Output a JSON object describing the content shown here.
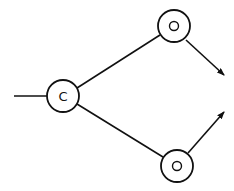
{
  "diagram": {
    "stroke_color": "#111111",
    "background": "#ffffff",
    "nodes": [
      {
        "id": "c",
        "label": "C",
        "cx": 63,
        "cy": 96,
        "r": 16
      },
      {
        "id": "o-top",
        "label": "O",
        "cx": 174,
        "cy": 26,
        "r": 16
      },
      {
        "id": "o-bottom",
        "label": "O",
        "cx": 177,
        "cy": 166,
        "r": 16
      }
    ],
    "edges": [
      {
        "from": "input",
        "to": "c",
        "arrow": false
      },
      {
        "from": "c",
        "to": "o-top",
        "arrow": false
      },
      {
        "from": "c",
        "to": "o-bottom",
        "arrow": false
      },
      {
        "from": "o-top",
        "to": "output",
        "arrow": true
      },
      {
        "from": "o-bottom",
        "to": "output",
        "arrow": true
      }
    ]
  }
}
